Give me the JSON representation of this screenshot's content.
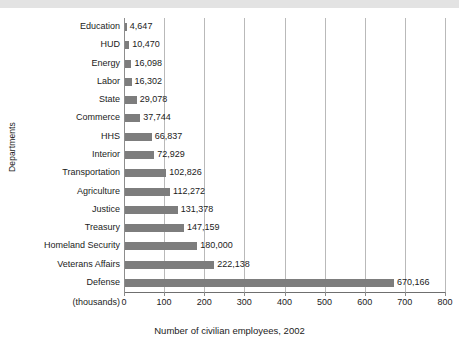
{
  "figure": {
    "background_color": "#ffffff",
    "band_color": "#e3e3e3",
    "bar_color": "#7d7d7d",
    "gridline_color": "#b9b9b9",
    "axis_color": "#6f6f6f",
    "text_color": "#1b1b1b"
  },
  "axis": {
    "y_title": "Departments",
    "x_title": "Number of civilian employees, 2002",
    "units_label": "(thousands)"
  },
  "chart_data": {
    "type": "bar",
    "orientation": "horizontal",
    "title": "",
    "subtitle": "",
    "xlabel": "Number of civilian employees, 2002",
    "ylabel": "Departments",
    "units": "thousands",
    "xlim": [
      0,
      800
    ],
    "xticks": [
      0,
      100,
      200,
      300,
      400,
      500,
      600,
      700,
      800
    ],
    "xtick_labels": [
      "0",
      "100",
      "200",
      "300",
      "400",
      "500",
      "600",
      "700",
      "800"
    ],
    "grid": "vertical",
    "legend": "none",
    "categories": [
      "Education",
      "HUD",
      "Energy",
      "Labor",
      "State",
      "Commerce",
      "HHS",
      "Interior",
      "Transportation",
      "Agriculture",
      "Justice",
      "Treasury",
      "Homeland Security",
      "Veterans Affairs",
      "Defense"
    ],
    "values": [
      4647,
      10470,
      16098,
      16302,
      29078,
      37744,
      66837,
      72929,
      102826,
      112272,
      131378,
      147159,
      180000,
      222138,
      670166
    ],
    "value_labels": [
      "4,647",
      "10,470",
      "16,098",
      "16,302",
      "29,078",
      "37,744",
      "66,837",
      "72,929",
      "102,826",
      "112,272",
      "131,378",
      "147,159",
      "180,000",
      "222,138",
      "670,166"
    ]
  }
}
